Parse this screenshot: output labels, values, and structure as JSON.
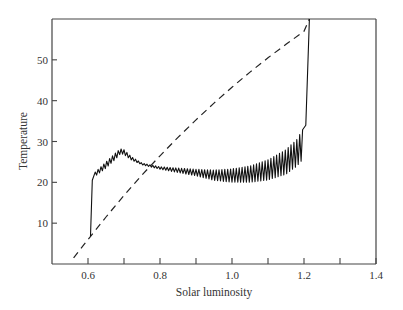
{
  "chart_data": {
    "type": "line",
    "title": "",
    "xlabel": "Solar luminosity",
    "ylabel": "Temperature",
    "xlim": [
      0.5,
      1.4
    ],
    "ylim": [
      0,
      60
    ],
    "grid": false,
    "legend": null,
    "x_ticks": [
      0.6,
      0.7,
      0.8,
      0.9,
      1.0,
      1.1,
      1.2,
      1.3,
      1.4
    ],
    "x_tick_labels": [
      "0.6",
      "",
      "0.8",
      "",
      "1.0",
      "",
      "1.2",
      "",
      "1.4"
    ],
    "y_ticks": [
      10,
      20,
      30,
      40,
      50
    ],
    "y_tick_labels": [
      "10",
      "20",
      "30",
      "40",
      "50"
    ],
    "series": [
      {
        "name": "dashed curve (no life)",
        "style": "dashed",
        "color": "#222222",
        "x": [
          0.56,
          0.6,
          0.65,
          0.7,
          0.75,
          0.8,
          0.85,
          0.9,
          0.95,
          1.0,
          1.05,
          1.1,
          1.15,
          1.2,
          1.215
        ],
        "y": [
          1.5,
          6.0,
          11.5,
          16.8,
          21.8,
          26.5,
          31.0,
          35.3,
          39.4,
          43.3,
          47.0,
          50.5,
          53.8,
          57.0,
          60.0
        ]
      },
      {
        "name": "solid curve (with daisies, oscillating)",
        "style": "solid",
        "color": "#111111",
        "envelope_x": [
          0.607,
          0.612,
          0.62,
          0.65,
          0.68,
          0.69,
          0.7,
          0.72,
          0.75,
          0.8,
          0.85,
          0.9,
          0.95,
          1.0,
          1.05,
          1.1,
          1.15,
          1.18,
          1.2,
          1.205,
          1.215
        ],
        "envelope_low": [
          6.8,
          20.5,
          21.5,
          23.5,
          26.0,
          27.0,
          26.8,
          25.5,
          24.3,
          23.2,
          22.4,
          21.6,
          20.5,
          20.0,
          20.0,
          20.6,
          22.0,
          24.0,
          26.0,
          26.5,
          60.0
        ],
        "envelope_high": [
          6.8,
          20.5,
          22.5,
          25.0,
          27.5,
          28.2,
          28.0,
          26.3,
          24.7,
          23.8,
          23.5,
          23.2,
          23.0,
          23.3,
          24.0,
          25.5,
          28.0,
          30.5,
          33.5,
          34.0,
          60.0
        ],
        "oscillation_period": 0.008
      }
    ]
  }
}
